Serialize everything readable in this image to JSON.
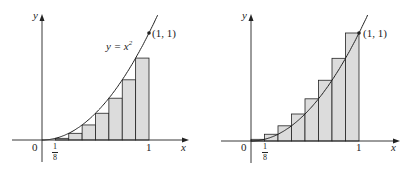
{
  "chart_data": [
    {
      "type": "area",
      "title": "Lower sum (left endpoints) approximation of area under y = x^2",
      "function": "y = x^2",
      "function_label": "y = x²",
      "xlabel": "x",
      "ylabel": "y",
      "x_ticks": [
        "0",
        "1/8",
        "1"
      ],
      "point_label": "(1, 1)",
      "xlim": [
        0,
        1
      ],
      "ylim": [
        0,
        1
      ],
      "n_rectangles": 8,
      "rect_width": 0.125,
      "x_left": [
        0,
        0.125,
        0.25,
        0.375,
        0.5,
        0.625,
        0.75,
        0.875
      ],
      "rect_heights": [
        0,
        0.015625,
        0.0625,
        0.140625,
        0.25,
        0.390625,
        0.5625,
        0.765625
      ]
    },
    {
      "type": "area",
      "title": "Upper sum (right endpoints) approximation of area under y = x^2",
      "function": "y = x^2",
      "xlabel": "x",
      "ylabel": "y",
      "x_ticks": [
        "0",
        "1/8",
        "1"
      ],
      "point_label": "(1, 1)",
      "xlim": [
        0,
        1
      ],
      "ylim": [
        0,
        1
      ],
      "n_rectangles": 8,
      "rect_width": 0.125,
      "x_right": [
        0.125,
        0.25,
        0.375,
        0.5,
        0.625,
        0.75,
        0.875,
        1
      ],
      "rect_heights": [
        0.015625,
        0.0625,
        0.140625,
        0.25,
        0.390625,
        0.5625,
        0.765625,
        1
      ]
    }
  ],
  "left": {
    "y_label": "y",
    "x_label": "x",
    "origin": "0",
    "tick_one": "1",
    "frac_num": "1",
    "frac_den": "8",
    "curve_label_lhs": "y = x",
    "curve_label_exp": "2",
    "point_label": "(1, 1)"
  },
  "right": {
    "y_label": "y",
    "x_label": "x",
    "origin": "0",
    "tick_one": "1",
    "frac_num": "1",
    "frac_den": "8",
    "point_label": "(1, 1)"
  },
  "colors": {
    "fill": "#dcdcdc",
    "stroke": "#222222"
  }
}
